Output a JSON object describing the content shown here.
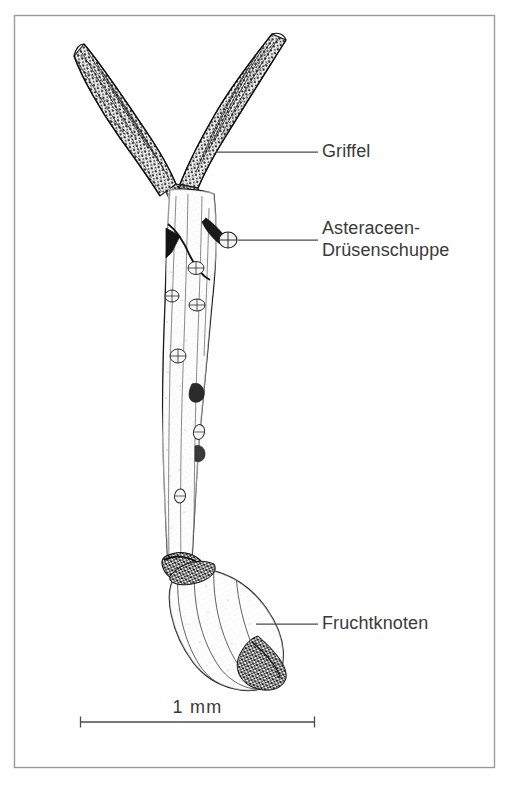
{
  "figure": {
    "kind": "botanical-line-drawing",
    "background_color": "#ffffff",
    "ink_color": "#1a1a1a",
    "text_color": "#3a3a3a",
    "frame": {
      "name": "figure-border",
      "color": "#9a9a9a",
      "x": 14,
      "y": 15,
      "width": 481,
      "height": 753
    },
    "labels": [
      {
        "id": "griffel",
        "text": "Griffel",
        "lines": [
          "Griffel"
        ],
        "leader": {
          "x1": 216,
          "y1": 152,
          "x2": 318,
          "y2": 152
        }
      },
      {
        "id": "gland",
        "text": "Asteraceen-Drüsenschuppe",
        "lines": [
          "Asteraceen-",
          "Drüsenschuppe"
        ],
        "leader": {
          "x1": 228,
          "y1": 240,
          "x2": 318,
          "y2": 240
        }
      },
      {
        "id": "ovary",
        "text": "Fruchtknoten",
        "lines": [
          "Fruchtknoten"
        ],
        "leader": {
          "x1": 256,
          "y1": 624,
          "x2": 318,
          "y2": 624
        }
      }
    ],
    "scale_bar": {
      "label": "1  mm",
      "x1": 80,
      "x2": 315,
      "y": 722,
      "cap_height": 11
    },
    "parts": [
      {
        "name": "stigma-branch-left",
        "label_ref": "griffel"
      },
      {
        "name": "stigma-branch-right",
        "label_ref": "griffel"
      },
      {
        "name": "style-shaft",
        "label_ref": "griffel"
      },
      {
        "name": "glandular-scale",
        "label_ref": "gland"
      },
      {
        "name": "ovary",
        "label_ref": "ovary"
      }
    ]
  }
}
